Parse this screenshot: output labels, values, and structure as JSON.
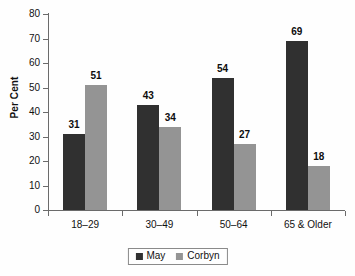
{
  "chart_data": {
    "type": "bar",
    "title": "",
    "subtitle": "",
    "xlabel": "",
    "ylabel": "Per Cent",
    "ylim": [
      0,
      80
    ],
    "ytick_step": 10,
    "yticks": [
      "0",
      "10",
      "20",
      "30",
      "40",
      "50",
      "60",
      "70",
      "80"
    ],
    "grid": false,
    "legend_position": "bottom-center",
    "categories": [
      "18–29",
      "30–49",
      "50–64",
      "65 & Older"
    ],
    "series": [
      {
        "name": "May",
        "color": "#303030",
        "values": [
          31,
          43,
          54,
          69
        ],
        "labels": [
          "31",
          "43",
          "54",
          "69"
        ]
      },
      {
        "name": "Corbyn",
        "color": "#949494",
        "values": [
          51,
          34,
          27,
          18
        ],
        "labels": [
          "51",
          "34",
          "27",
          "18"
        ]
      }
    ]
  },
  "legend": {
    "items": [
      {
        "label": "May",
        "color": "#303030"
      },
      {
        "label": "Corbyn",
        "color": "#949494"
      }
    ]
  },
  "axes": {
    "y_title": "Per Cent",
    "y_tick_labels": [
      "80",
      "70",
      "60",
      "50",
      "40",
      "30",
      "20",
      "10",
      "0"
    ],
    "x_tick_labels": [
      "18–29",
      "30–49",
      "50–64",
      "65 & Older"
    ]
  },
  "colors": {
    "series_may": "#303030",
    "series_corbyn": "#949494",
    "axis": "#6b6b6b",
    "text": "#111111",
    "background": "#fefefe"
  }
}
